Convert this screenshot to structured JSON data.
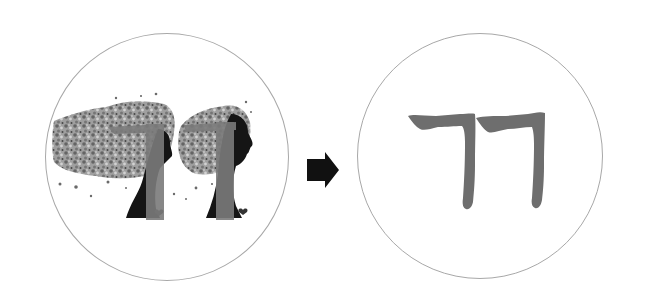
{
  "diagram": {
    "type": "transformation",
    "left_panel": {
      "description": "Stylized artwork: two female silhouettes in profile with scattered, textured flowing hair, overlaid with a gray double-consonant glyph",
      "glyph": "ㄲ",
      "border_color": "#a8a8a8"
    },
    "arrow": {
      "direction": "right",
      "color": "#111111"
    },
    "right_panel": {
      "description": "Extracted glyph rendered alone in gray brush stroke",
      "glyph": "ㄲ",
      "glyph_color": "#6e6e6e",
      "border_color": "#a8a8a8"
    }
  },
  "colors": {
    "background": "#ffffff",
    "circle_border": "#a8a8a8",
    "glyph_gray": "#6e6e6e",
    "silhouette": "#151515",
    "hair_texture": "#8a8a8a"
  }
}
